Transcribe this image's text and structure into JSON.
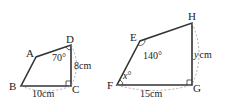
{
  "figures": [
    {
      "name": "quadrilateral-ABCD",
      "vertices": {
        "A": "A",
        "B": "B",
        "C": "C",
        "D": "D"
      },
      "angle_D": "70°",
      "side_DC": "8cm",
      "side_BC": "10cm",
      "right_angle_at": "C"
    },
    {
      "name": "quadrilateral-EFGH",
      "vertices": {
        "E": "E",
        "F": "F",
        "G": "G",
        "H": "H"
      },
      "angle_E": "140°",
      "angle_F_var": "x",
      "angle_F_deg": "°",
      "side_HG_var": "y",
      "side_HG_unit": "cm",
      "side_FG": "15cm",
      "right_angle_at": "G"
    }
  ]
}
